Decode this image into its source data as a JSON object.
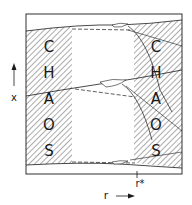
{
  "diagram": {
    "region_label_left": [
      "C",
      "H",
      "A",
      "O",
      "S"
    ],
    "region_label_right": [
      "C",
      "H",
      "A",
      "O",
      "S"
    ],
    "y_axis_label": "x",
    "x_axis_label": "r",
    "critical_marker": "r*",
    "colors": {
      "ink": "#1a1a1a",
      "hatch": "#444444",
      "background": "#ffffff"
    }
  }
}
